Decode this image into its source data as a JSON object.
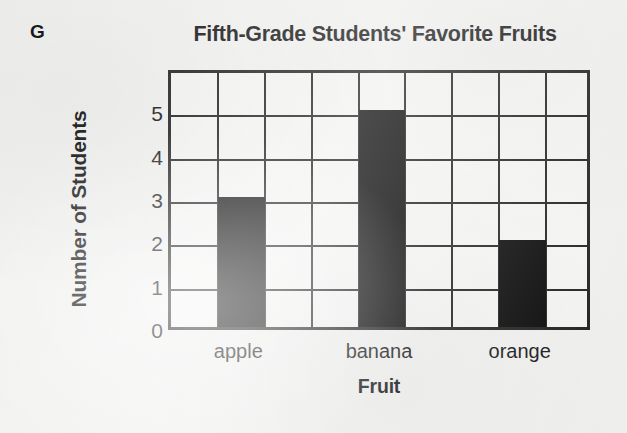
{
  "figure": {
    "label": "G"
  },
  "chart_data": {
    "type": "bar",
    "title": "Fifth-Grade Students' Favorite Fruits",
    "xlabel": "Fruit",
    "ylabel": "Number of Students",
    "categories": [
      "apple",
      "banana",
      "orange"
    ],
    "values": [
      3,
      5,
      2
    ],
    "ytick_labels": [
      "0",
      "1",
      "2",
      "3",
      "4",
      "5"
    ],
    "ytick_values": [
      0,
      1,
      2,
      3,
      4,
      5
    ],
    "ylim": [
      0,
      6
    ],
    "grid": true,
    "grid_columns": 9,
    "grid_rows": 6,
    "bar_columns": [
      2,
      5,
      8
    ],
    "legend": "none",
    "bar_color": "#000000",
    "axis_color": "#1a1a1a",
    "plot_background": "#f6f6f5",
    "page_background": "#f2f2f1"
  }
}
